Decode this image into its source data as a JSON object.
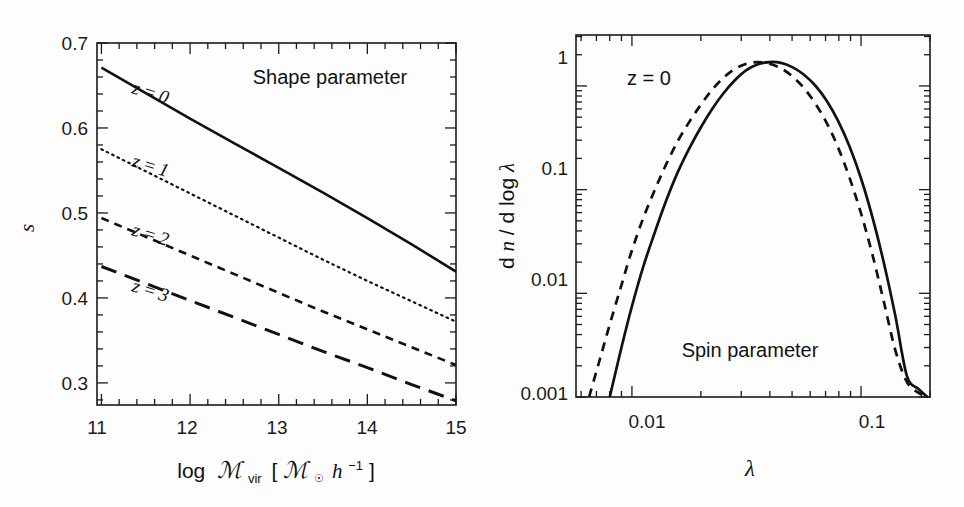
{
  "figure": {
    "background": "#fdfdfd",
    "ink": "#111111",
    "panels": [
      "shape-parameter-panel",
      "spin-parameter-panel"
    ]
  },
  "left_panel": {
    "annotation": "Shape parameter",
    "y_axis_title": "s",
    "x_axis_title_parts": {
      "log": "log",
      "M": "ℳ",
      "vir": "vir",
      "bracket_open": "[",
      "M2": "ℳ",
      "sun": "☉",
      "h": "h",
      "exp": "−1",
      "bracket_close": "]"
    },
    "x_tick_labels": [
      "11",
      "12",
      "13",
      "14",
      "15"
    ],
    "y_tick_labels": [
      "0.3",
      "0.4",
      "0.5",
      "0.6",
      "0.7"
    ],
    "curve_labels": [
      "z = 0",
      "z = 1",
      "z = 2",
      "z = 3"
    ]
  },
  "right_panel": {
    "annotation_top": "z = 0",
    "annotation_bottom": "Spin parameter",
    "y_axis_title_parts": {
      "d1": "d",
      "n": "n",
      "slash": " / ",
      "d2": "d log ",
      "lambda": "λ"
    },
    "x_axis_title": "λ",
    "x_tick_labels": [
      "0.01",
      "0.1"
    ],
    "y_tick_labels": [
      "0.001",
      "0.01",
      "0.1",
      "1"
    ]
  },
  "chart_data": [
    {
      "id": "shape-parameter",
      "type": "line",
      "title": "Shape parameter",
      "xlabel": "log M_vir [M_sun h^-1]",
      "ylabel": "s",
      "xlim": [
        10.95,
        15.0
      ],
      "ylim": [
        0.274,
        0.7
      ],
      "xscale": "linear",
      "yscale": "linear",
      "grid": false,
      "x_major_ticks": [
        11,
        12,
        13,
        14,
        15
      ],
      "y_major_ticks": [
        0.3,
        0.4,
        0.5,
        0.6,
        0.7
      ],
      "x_minor_tick_step": 0.2,
      "y_minor_tick_step": 0.02,
      "legend": "inline-labels",
      "series": [
        {
          "name": "z = 0",
          "style": "solid",
          "x": [
            11.0,
            11.5,
            12.0,
            12.5,
            13.0,
            13.5,
            14.0,
            14.5,
            15.0
          ],
          "values": [
            0.671,
            0.641,
            0.611,
            0.582,
            0.553,
            0.524,
            0.494,
            0.463,
            0.431
          ]
        },
        {
          "name": "z = 1",
          "style": "dotted",
          "x": [
            11.0,
            11.5,
            12.0,
            12.5,
            13.0,
            13.5,
            14.0,
            14.5,
            15.0
          ],
          "values": [
            0.575,
            0.549,
            0.523,
            0.497,
            0.471,
            0.445,
            0.42,
            0.396,
            0.372
          ]
        },
        {
          "name": "z = 2",
          "style": "dashed",
          "x": [
            11.0,
            11.5,
            12.0,
            12.5,
            13.0,
            13.5,
            14.0,
            14.5,
            15.0
          ],
          "values": [
            0.494,
            0.472,
            0.45,
            0.428,
            0.406,
            0.384,
            0.363,
            0.342,
            0.321
          ]
        },
        {
          "name": "z = 3",
          "style": "longdash",
          "x": [
            11.0,
            11.5,
            12.0,
            12.5,
            13.0,
            13.5,
            14.0,
            14.5,
            15.0
          ],
          "values": [
            0.437,
            0.417,
            0.397,
            0.377,
            0.357,
            0.337,
            0.318,
            0.298,
            0.279
          ]
        }
      ]
    },
    {
      "id": "spin-parameter",
      "type": "line",
      "title": "Spin parameter",
      "xlabel": "λ",
      "ylabel": "dn / d log λ",
      "xscale": "log",
      "yscale": "log",
      "xlim": [
        0.0057,
        0.2
      ],
      "ylim": [
        0.001,
        3.1
      ],
      "grid": false,
      "x_major_ticks": [
        0.01,
        0.1
      ],
      "y_major_ticks": [
        0.001,
        0.01,
        0.1,
        1
      ],
      "annotation": "z = 0",
      "series": [
        {
          "name": "solid-distribution",
          "style": "solid",
          "x": [
            0.008,
            0.009,
            0.01,
            0.0112,
            0.0126,
            0.0141,
            0.0158,
            0.0178,
            0.02,
            0.0224,
            0.0251,
            0.0282,
            0.0316,
            0.0355,
            0.0398,
            0.0447,
            0.0501,
            0.0562,
            0.0631,
            0.0708,
            0.0794,
            0.0891,
            0.1,
            0.1122,
            0.1259,
            0.1413,
            0.1585,
            0.1778,
            0.195
          ],
          "values": [
            0.001,
            0.003,
            0.0075,
            0.018,
            0.039,
            0.078,
            0.145,
            0.25,
            0.4,
            0.6,
            0.85,
            1.14,
            1.42,
            1.62,
            1.7,
            1.67,
            1.52,
            1.29,
            1.01,
            0.72,
            0.46,
            0.26,
            0.128,
            0.054,
            0.0195,
            0.006,
            0.0016,
            0.0012,
            0.001
          ]
        },
        {
          "name": "dashed-distribution",
          "style": "dashed",
          "x": [
            0.0065,
            0.0072,
            0.008,
            0.009,
            0.01,
            0.0112,
            0.0126,
            0.0141,
            0.0158,
            0.0178,
            0.02,
            0.0224,
            0.0251,
            0.0282,
            0.0316,
            0.0355,
            0.0398,
            0.0447,
            0.0501,
            0.0562,
            0.0631,
            0.0708,
            0.0794,
            0.0891,
            0.1,
            0.1122,
            0.1259,
            0.1413,
            0.1585,
            0.1778,
            0.195
          ],
          "values": [
            0.001,
            0.0022,
            0.005,
            0.012,
            0.026,
            0.053,
            0.1,
            0.175,
            0.29,
            0.45,
            0.66,
            0.92,
            1.2,
            1.46,
            1.64,
            1.7,
            1.64,
            1.48,
            1.24,
            0.96,
            0.68,
            0.44,
            0.255,
            0.13,
            0.059,
            0.0235,
            0.0082,
            0.0028,
            0.0014,
            0.0011,
            0.001
          ]
        }
      ]
    }
  ]
}
